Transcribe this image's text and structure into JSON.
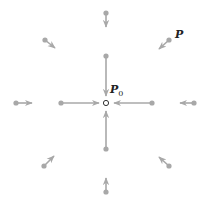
{
  "diagram": {
    "type": "vector-field-sink",
    "center": {
      "label": "P",
      "subscript": "0",
      "x": 106,
      "y": 103
    },
    "point_label": {
      "label": "P"
    },
    "color": "#a8a8a8",
    "vectors": [
      {
        "from": [
          106,
          56
        ],
        "to": [
          106,
          96
        ]
      },
      {
        "from": [
          61,
          103
        ],
        "to": [
          99,
          103
        ]
      },
      {
        "from": [
          152,
          103
        ],
        "to": [
          114,
          103
        ]
      },
      {
        "from": [
          106,
          149
        ],
        "to": [
          106,
          111
        ]
      },
      {
        "from": [
          106,
          13
        ],
        "to": [
          106,
          27
        ]
      },
      {
        "from": [
          16,
          103
        ],
        "to": [
          32,
          103
        ]
      },
      {
        "from": [
          194,
          103
        ],
        "to": [
          180,
          103
        ]
      },
      {
        "from": [
          106,
          192
        ],
        "to": [
          106,
          178
        ]
      },
      {
        "from": [
          45,
          40
        ],
        "to": [
          55,
          48
        ]
      },
      {
        "from": [
          169,
          40
        ],
        "to": [
          159,
          49
        ]
      },
      {
        "from": [
          44,
          166
        ],
        "to": [
          54,
          156
        ]
      },
      {
        "from": [
          169,
          166
        ],
        "to": [
          159,
          157
        ]
      }
    ]
  }
}
